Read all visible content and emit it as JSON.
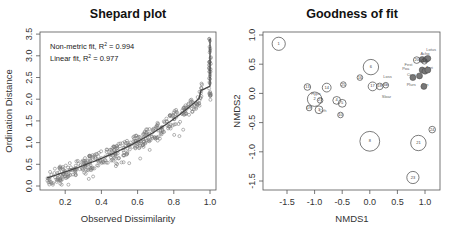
{
  "chart_data": [
    {
      "type": "scatter",
      "title": "Shepard plot",
      "xlabel": "Observed Dissimilarity",
      "ylabel": "Ordination Distance",
      "xlim": [
        0.05,
        1.03
      ],
      "ylim": [
        -0.1,
        3.55
      ],
      "xticks": [
        "0.2",
        "0.4",
        "0.6",
        "0.8",
        "1.0"
      ],
      "xtick_values": [
        0.2,
        0.4,
        0.6,
        0.8,
        1.0
      ],
      "yticks": [
        "0.0",
        "0.5",
        "1.0",
        "1.5",
        "2.0",
        "2.5",
        "3.0",
        "3.5"
      ],
      "ytick_values": [
        0.0,
        0.5,
        1.0,
        1.5,
        2.0,
        2.5,
        3.0,
        3.5
      ],
      "grid": false,
      "legend_position": "top-left",
      "annotations": [
        {
          "text": "Non-metric fit, R² = 0.994",
          "label": "Non-metric fit, R",
          "sup": "2",
          "value": " = 0.994"
        },
        {
          "text": "Linear fit, R² = 0.977",
          "label": "Linear fit, R",
          "sup": "2",
          "value": " = 0.977"
        }
      ],
      "series": [
        {
          "name": "Non-metric fit (step line)",
          "x": [
            0.1,
            0.2,
            0.3,
            0.4,
            0.5,
            0.6,
            0.7,
            0.8,
            0.9,
            0.95,
            0.99,
            1.0,
            1.0
          ],
          "y": [
            0.1,
            0.25,
            0.4,
            0.6,
            0.8,
            1.0,
            1.3,
            1.6,
            2.05,
            2.2,
            2.3,
            2.8,
            3.4
          ]
        },
        {
          "name": "Observations (open circles)",
          "x_range": [
            0.1,
            1.0
          ],
          "y_range": [
            0.05,
            3.4
          ],
          "approx_count": 420
        }
      ]
    },
    {
      "type": "scatter",
      "title": "Goodness of fit",
      "xlabel": "NMDS1",
      "ylabel": "NMDS2",
      "xlim": [
        -1.82,
        1.25
      ],
      "ylim": [
        -1.65,
        1.05
      ],
      "xticks": [
        "-1.5",
        "-1.0",
        "-0.5",
        "0.0",
        "0.5",
        "1.0"
      ],
      "xtick_values": [
        -1.5,
        -1.0,
        -0.5,
        0.0,
        0.5,
        1.0
      ],
      "yticks": [
        "-1.5",
        "-1.0",
        "-0.5",
        "0.0",
        "0.5",
        "1.0"
      ],
      "ytick_values": [
        -1.5,
        -1.0,
        -0.5,
        0.0,
        0.5,
        1.0
      ],
      "grid": false,
      "sites": [
        {
          "label": "1",
          "x": -1.65,
          "y": 0.85,
          "r": 0.12
        },
        {
          "label": "2",
          "x": -1.0,
          "y": -0.1,
          "r": 0.13
        },
        {
          "label": "3",
          "x": -0.92,
          "y": -0.28,
          "r": 0.07
        },
        {
          "label": "4",
          "x": -0.6,
          "y": -0.12,
          "r": 0.07
        },
        {
          "label": "5",
          "x": -0.5,
          "y": -0.17,
          "r": 0.07
        },
        {
          "label": "6",
          "x": 0.02,
          "y": 0.45,
          "r": 0.14
        },
        {
          "label": "8",
          "x": 0.0,
          "y": -0.82,
          "r": 0.18
        },
        {
          "label": "10",
          "x": -0.53,
          "y": -0.37,
          "r": 0.05
        },
        {
          "label": "13",
          "x": -1.13,
          "y": 0.11,
          "r": 0.06
        },
        {
          "label": "14",
          "x": -0.78,
          "y": 0.1,
          "r": 0.08
        },
        {
          "label": "16",
          "x": -0.18,
          "y": 0.27,
          "r": 0.05
        },
        {
          "label": "17",
          "x": 0.05,
          "y": 0.12,
          "r": 0.08
        },
        {
          "label": "18",
          "x": 0.18,
          "y": 0.12,
          "r": 0.06
        },
        {
          "label": "19",
          "x": -1.1,
          "y": -0.25,
          "r": 0.05
        },
        {
          "label": "20",
          "x": 0.85,
          "y": 0.57,
          "r": 0.06
        },
        {
          "label": "21",
          "x": 0.88,
          "y": -0.85,
          "r": 0.14
        },
        {
          "label": "23",
          "x": 0.78,
          "y": -1.44,
          "r": 0.11
        },
        {
          "label": "24",
          "x": 1.13,
          "y": -0.62,
          "r": 0.06
        },
        {
          "label": "25",
          "x": -0.48,
          "y": 0.15,
          "r": 0.05
        },
        {
          "label": "27",
          "x": -0.9,
          "y": -0.12,
          "r": 0.05
        },
        {
          "label": "28",
          "x": 0.99,
          "y": 0.55,
          "r": 0.05
        },
        {
          "label": "6b",
          "x": 0.29,
          "y": 0.14,
          "r": 0.05
        }
      ],
      "species": [
        {
          "label": "Loss",
          "x": 0.32,
          "y": 0.26
        },
        {
          "label": "Sloar",
          "x": 0.3,
          "y": -0.08
        },
        {
          "label": "Plurs",
          "x": 0.75,
          "y": 0.12
        },
        {
          "label": "Ann",
          "x": 1.0,
          "y": 0.12
        },
        {
          "label": "Lotus",
          "x": 1.11,
          "y": 0.73
        },
        {
          "label": "Acho",
          "x": 1.0,
          "y": 0.65
        },
        {
          "label": "Fest",
          "x": 0.7,
          "y": 0.47
        },
        {
          "label": "Poa",
          "x": 0.65,
          "y": 0.4
        },
        {
          "label": "Cerv",
          "x": 0.75,
          "y": 0.3
        },
        {
          "label": "Agri",
          "x": 1.08,
          "y": 0.42
        },
        {
          "label": "Hype",
          "x": -0.98,
          "y": -0.02
        },
        {
          "label": "Cirh",
          "x": -0.85,
          "y": -0.32
        }
      ]
    }
  ],
  "panels": {
    "left": {
      "title": "Shepard plot",
      "xlabel": "Observed Dissimilarity",
      "ylabel": "Ordination Distance",
      "legend_line1_label": "Non-metric fit, R",
      "legend_line1_sup": "2",
      "legend_line1_value": " = 0.994",
      "legend_line2_label": "Linear fit, R",
      "legend_line2_sup": "2",
      "legend_line2_value": " = 0.977",
      "xticks": [
        "0.2",
        "0.4",
        "0.6",
        "0.8",
        "1.0"
      ],
      "yticks": [
        "0.0",
        "0.5",
        "1.0",
        "1.5",
        "2.0",
        "2.5",
        "3.0",
        "3.5"
      ]
    },
    "right": {
      "title": "Goodness of fit",
      "xlabel": "NMDS1",
      "ylabel": "NMDS2",
      "xticks": [
        "-1.5",
        "-1.0",
        "-0.5",
        "0.0",
        "0.5",
        "1.0"
      ],
      "yticks": [
        "-1.5",
        "-1.0",
        "-0.5",
        "0.0",
        "0.5",
        "1.0"
      ]
    }
  }
}
